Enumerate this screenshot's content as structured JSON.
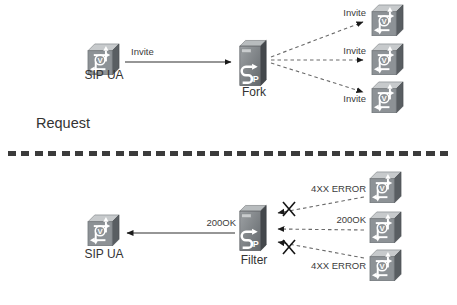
{
  "sections": {
    "request": {
      "heading": "Request",
      "ua_label": "SIP UA",
      "arrow_label": "Invite",
      "server_label": "Fork",
      "branches": [
        {
          "label": "Invite",
          "blocked": false
        },
        {
          "label": "Invite",
          "blocked": false
        },
        {
          "label": "Invite",
          "blocked": false
        }
      ]
    },
    "response": {
      "ua_label": "SIP UA",
      "arrow_label": "200OK",
      "server_label": "Filter",
      "branches": [
        {
          "label": "4XX ERROR",
          "blocked": true
        },
        {
          "label": "200OK",
          "blocked": false
        },
        {
          "label": "4XX ERROR",
          "blocked": true
        }
      ]
    }
  },
  "icons": {
    "voice_router": "voice-enabled-router-icon",
    "voice_router_letter": "V",
    "sip_server": "sip-server-icon",
    "sip_server_letters": "IP",
    "blocked_x": "blocked-x-icon"
  },
  "colors": {
    "background": "#ffffff",
    "solid_line": "#2e2e2e",
    "dashed_line": "#6a6a6a",
    "text": "#3c3c3c",
    "icon_front": "#8d9296",
    "icon_top": "#c7cacc",
    "icon_side": "#595e62"
  }
}
